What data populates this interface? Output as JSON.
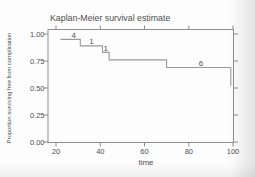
{
  "colors": {
    "background": "#fdfdfd",
    "axis": "#8e8e8e",
    "curve": "#9a9a9a",
    "text": "#4f4f4f"
  },
  "chart_data": {
    "type": "line",
    "variant": "kaplan-meier-step",
    "title": "Kaplan-Meier survival estimate",
    "xlabel": "time",
    "ylabel": "Proportion surviving free from complication",
    "xlim": [
      20,
      100
    ],
    "ylim": [
      0.0,
      1.0
    ],
    "grid": false,
    "legend": "none",
    "xticks": [
      {
        "v": 20,
        "label": "20"
      },
      {
        "v": 40,
        "label": "40"
      },
      {
        "v": 60,
        "label": "60"
      },
      {
        "v": 80,
        "label": "80"
      },
      {
        "v": 100,
        "label": "100"
      }
    ],
    "yticks": [
      {
        "v": 0.0,
        "label": "0.00"
      },
      {
        "v": 0.25,
        "label": "0.25"
      },
      {
        "v": 0.5,
        "label": "0.50"
      },
      {
        "v": 0.75,
        "label": "0.75"
      },
      {
        "v": 1.0,
        "label": "1.00"
      }
    ],
    "series": [
      {
        "name": "survival-estimate",
        "steps": [
          {
            "time": 22,
            "survival": 0.95
          },
          {
            "time": 31,
            "survival": 0.89
          },
          {
            "time": 41,
            "survival": 0.83
          },
          {
            "time": 44,
            "survival": 0.76
          },
          {
            "time": 70,
            "survival": 0.69
          },
          {
            "time": 99,
            "survival": 0.52
          }
        ]
      }
    ],
    "censored_labels": [
      {
        "label": "4",
        "time": 28,
        "level": 0.95
      },
      {
        "label": "1",
        "time": 36,
        "level": 0.89
      },
      {
        "label": "1",
        "time": 42.5,
        "level": 0.83
      },
      {
        "label": "6",
        "time": 85.5,
        "level": 0.69
      }
    ]
  }
}
